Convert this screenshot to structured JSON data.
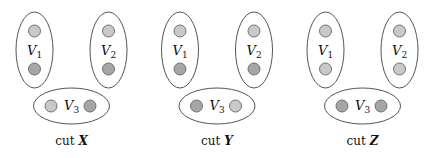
{
  "colors": {
    "light_node": "#c9c9c9",
    "dark_node": "#a6a6a6",
    "outline": "#555555"
  },
  "panels": [
    {
      "caption_prefix": "cut",
      "caption_var": "X",
      "groups": [
        {
          "label": "V",
          "sub": "1",
          "nodes": [
            "light",
            "dark"
          ]
        },
        {
          "label": "V",
          "sub": "2",
          "nodes": [
            "light",
            "dark"
          ]
        },
        {
          "label": "V",
          "sub": "3",
          "nodes": [
            "light",
            "dark"
          ]
        }
      ]
    },
    {
      "caption_prefix": "cut",
      "caption_var": "Y",
      "groups": [
        {
          "label": "V",
          "sub": "1",
          "nodes": [
            "light",
            "dark"
          ]
        },
        {
          "label": "V",
          "sub": "2",
          "nodes": [
            "light",
            "dark"
          ]
        },
        {
          "label": "V",
          "sub": "3",
          "nodes": [
            "dark",
            "light"
          ]
        }
      ]
    },
    {
      "caption_prefix": "cut",
      "caption_var": "Z",
      "groups": [
        {
          "label": "V",
          "sub": "1",
          "nodes": [
            "light",
            "light"
          ]
        },
        {
          "label": "V",
          "sub": "2",
          "nodes": [
            "light",
            "light"
          ]
        },
        {
          "label": "V",
          "sub": "3",
          "nodes": [
            "dark",
            "dark"
          ]
        }
      ]
    }
  ]
}
